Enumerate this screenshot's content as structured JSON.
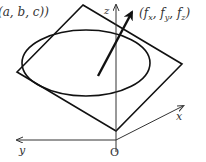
{
  "diagram": {
    "title": "",
    "labels": {
      "point": "(a, b, c))",
      "normal_vector": "(f",
      "normal_vector_sub_x": "x",
      "normal_vector_sep1": ", f",
      "normal_vector_sub_y": "y",
      "normal_vector_sep2": ", f",
      "normal_vector_sub_z": "z",
      "normal_vector_close": ")",
      "z_axis": "z",
      "x_axis": "x",
      "y_axis": "y",
      "origin": "O"
    },
    "colors": {
      "stroke": "#111111",
      "axis": "#333333",
      "text": "#333333",
      "background": "#ffffff"
    },
    "elements": [
      "tangent-plane-quadrilateral",
      "level-surface-ellipse",
      "normal-vector-arrow",
      "z-axis",
      "x-axis",
      "y-axis",
      "origin-label"
    ]
  }
}
